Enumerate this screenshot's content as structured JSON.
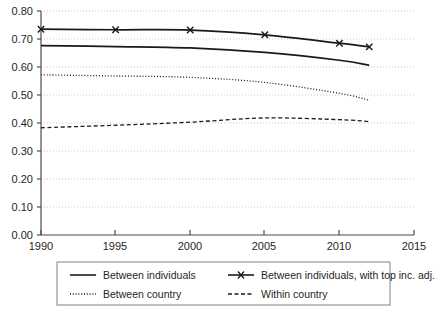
{
  "chart_data": {
    "type": "line",
    "title": "",
    "xlabel": "",
    "ylabel": "",
    "xlim": [
      1990,
      2015
    ],
    "ylim": [
      0.0,
      0.8
    ],
    "grid": true,
    "grid_axis": "y",
    "legend_position": "below-axes",
    "xticks": [
      "1990",
      "1995",
      "2000",
      "2005",
      "2010",
      "2015"
    ],
    "xtick_values": [
      1990,
      1995,
      2000,
      2005,
      2010,
      2015
    ],
    "yticks": [
      "0.00",
      "0.10",
      "0.20",
      "0.30",
      "0.40",
      "0.50",
      "0.60",
      "0.70",
      "0.80"
    ],
    "ytick_values": [
      0.0,
      0.1,
      0.2,
      0.3,
      0.4,
      0.5,
      0.6,
      0.7,
      0.8
    ],
    "x": [
      1990,
      1995,
      2000,
      2005,
      2010,
      2012
    ],
    "series": [
      {
        "name": "Between individuals, with top inc. adj.",
        "style": "solid-with-markers",
        "marker": "x",
        "color": "#1a1a1a",
        "values": [
          0.735,
          0.733,
          0.732,
          0.715,
          0.685,
          0.672
        ]
      },
      {
        "name": "Between individuals",
        "style": "solid",
        "marker": "none",
        "color": "#1a1a1a",
        "values": [
          0.676,
          0.673,
          0.668,
          0.652,
          0.624,
          0.606
        ]
      },
      {
        "name": "Between country",
        "style": "dotted",
        "marker": "none",
        "color": "#1a1a1a",
        "values": [
          0.572,
          0.568,
          0.563,
          0.545,
          0.506,
          0.482
        ]
      },
      {
        "name": "Within country",
        "style": "dashed",
        "marker": "none",
        "color": "#1a1a1a",
        "values": [
          0.383,
          0.392,
          0.403,
          0.418,
          0.412,
          0.405
        ]
      }
    ]
  },
  "legend": {
    "entries": [
      {
        "label": "Between individuals",
        "style": "solid",
        "marker": "none"
      },
      {
        "label": "Between individuals, with top inc. adj.",
        "style": "solid-with-markers",
        "marker": "x"
      },
      {
        "label": "Between country",
        "style": "dotted",
        "marker": "none"
      },
      {
        "label": "Within country",
        "style": "dashed",
        "marker": "none"
      }
    ]
  },
  "colors": {
    "line": "#1a1a1a",
    "axis": "#4d4d4d",
    "grid": "#c8c8c8",
    "legend_border": "#808080",
    "background": "#ffffff"
  }
}
